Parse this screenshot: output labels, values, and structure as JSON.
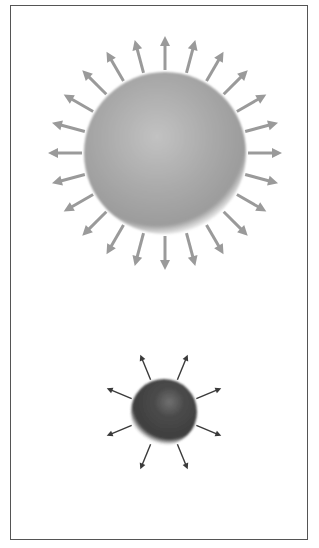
{
  "figure": {
    "frame": {
      "x": 10,
      "y": 5,
      "width": 298,
      "height": 535,
      "border_color": "#555555"
    },
    "large_star": {
      "label": "",
      "cx": 165,
      "cy": 153,
      "r": 78,
      "fill_edge": "#9c9c9c",
      "fill_mid": "#a9a9a9",
      "fill_highlight": "#c2c2c2",
      "highlight_offset": [
        -8,
        -18
      ],
      "arrow_count": 24,
      "arrow_start_angle_deg": 0,
      "arrow_inner_r": 83,
      "arrow_outer_r": 117,
      "arrow_color": "#9a9a9a",
      "arrow_width": 3,
      "arrow_head_len": 10,
      "arrow_head_half_w": 5
    },
    "small_star": {
      "label": "",
      "cx": 164,
      "cy": 412,
      "r": 30,
      "fill_edge": "#3e3e3e",
      "fill_mid": "#4a4a4a",
      "fill_highlight": "#707070",
      "highlight_offset": [
        6,
        -10
      ],
      "arrow_count": 8,
      "arrow_start_angle_deg": 22.5,
      "arrow_inner_r": 35,
      "arrow_outer_r": 62,
      "arrow_color": "#3a3a3a",
      "arrow_width": 1.4,
      "arrow_head_len": 6,
      "arrow_head_half_w": 3
    }
  }
}
